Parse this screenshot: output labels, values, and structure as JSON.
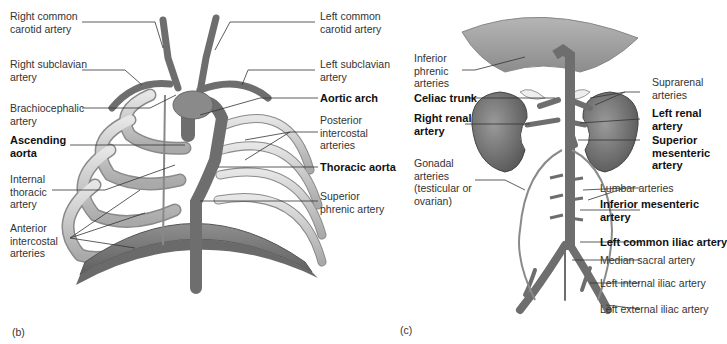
{
  "panel_b": {
    "tag": "(b)",
    "labels_left": [
      {
        "id": "right-common-carotid",
        "text": "Right common\ncarotid artery",
        "bold": false
      },
      {
        "id": "right-subclavian",
        "text": "Right subclavian\nartery",
        "bold": false
      },
      {
        "id": "brachiocephalic",
        "text": "Brachiocephalic\nartery",
        "bold": false
      },
      {
        "id": "ascending-aorta",
        "text": "Ascending\naorta",
        "bold": true
      },
      {
        "id": "internal-thoracic",
        "text": "Internal\nthoracic\nartery",
        "bold": false
      },
      {
        "id": "anterior-intercostal",
        "text": "Anterior\nintercostal\narteries",
        "bold": false
      }
    ],
    "labels_right": [
      {
        "id": "left-common-carotid",
        "text": "Left common\ncarotid artery",
        "bold": false
      },
      {
        "id": "left-subclavian",
        "text": "Left subclavian\nartery",
        "bold": false
      },
      {
        "id": "aortic-arch",
        "text": "Aortic arch",
        "bold": true
      },
      {
        "id": "posterior-intercostal",
        "text": "Posterior\nintercostal\narteries",
        "bold": false
      },
      {
        "id": "thoracic-aorta",
        "text": "Thoracic aorta",
        "bold": true
      },
      {
        "id": "superior-phrenic",
        "text": "Superior\nphrenic artery",
        "bold": false
      }
    ]
  },
  "panel_c": {
    "tag": "(c)",
    "labels_left": [
      {
        "id": "inferior-phrenic",
        "text": "Inferior\nphrenic\narteries",
        "bold": false
      },
      {
        "id": "celiac-trunk",
        "text": "Celiac trunk",
        "bold": true
      },
      {
        "id": "right-renal",
        "text": "Right renal\nartery",
        "bold": true
      },
      {
        "id": "gonadal",
        "text": "Gonadal\narteries\n(testicular or\novarian)",
        "bold": false
      }
    ],
    "labels_right": [
      {
        "id": "suprarenal",
        "text": "Suprarenal\narteries",
        "bold": false
      },
      {
        "id": "left-renal",
        "text": "Left renal\nartery",
        "bold": true
      },
      {
        "id": "superior-mesenteric",
        "text": "Superior\nmesenteric\nartery",
        "bold": true
      },
      {
        "id": "lumbar",
        "text": "Lumbar arteries",
        "bold": false
      },
      {
        "id": "inferior-mesenteric",
        "text": "Inferior mesenteric\nartery",
        "bold": true
      },
      {
        "id": "left-common-iliac",
        "text": "Left common iliac artery",
        "bold": true
      },
      {
        "id": "median-sacral",
        "text": "Median sacral artery",
        "bold": false
      },
      {
        "id": "left-internal-iliac",
        "text": "Left internal iliac artery",
        "bold": false
      },
      {
        "id": "left-external-iliac",
        "text": "Left external iliac artery",
        "bold": false
      }
    ]
  },
  "colors": {
    "artery": "#6e6e6e",
    "rib": "#c9c9c9",
    "rib_edge": "#8a8a8a",
    "diaphragm": "#7d7d7d",
    "kidney": "#7a7a7a",
    "leader": "#333333",
    "diaphragm_top": "#9a9a9a"
  }
}
